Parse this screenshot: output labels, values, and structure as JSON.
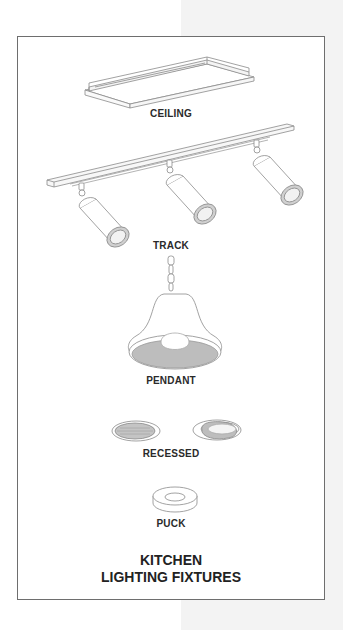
{
  "title": {
    "line1": "KITCHEN",
    "line2": "LIGHTING FIXTURES"
  },
  "fixtures": [
    {
      "id": "ceiling",
      "label": "CEILING"
    },
    {
      "id": "track",
      "label": "TRACK"
    },
    {
      "id": "pendant",
      "label": "PENDANT"
    },
    {
      "id": "recessed",
      "label": "RECESSED"
    },
    {
      "id": "puck",
      "label": "PUCK"
    }
  ],
  "colors": {
    "line": "#8a8a8a",
    "shade_fill": "#b8b8b8",
    "frame": "#6e6e6e",
    "background_strip": "#f3f3f3"
  }
}
